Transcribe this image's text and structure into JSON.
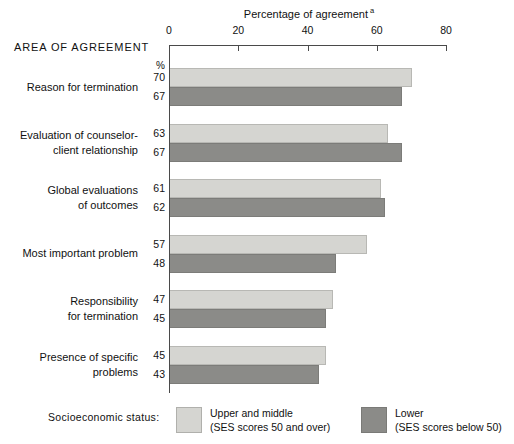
{
  "header": {
    "area_heading": "AREA OF AGREEMENT",
    "percent_symbol": "%"
  },
  "legend": {
    "title": "Socioeconomic status:",
    "items": [
      {
        "key": "upper",
        "label_line1": "Upper and middle",
        "label_line2": "(SES scores 50 and over)",
        "color": "#d5d5d1"
      },
      {
        "key": "lower",
        "label_line1": "Lower",
        "label_line2": "(SES scores below 50)",
        "color": "#8b8b88"
      }
    ]
  },
  "chart_data": {
    "type": "bar",
    "orientation": "horizontal",
    "title": "Percentage of agreement",
    "title_footnote": "a",
    "xlabel": "",
    "ylabel": "AREA OF AGREEMENT",
    "xlim": [
      0,
      80
    ],
    "xticks": [
      0,
      20,
      40,
      60,
      80
    ],
    "xtick_labels": [
      "0",
      "20",
      "40",
      "60",
      "80"
    ],
    "grid": false,
    "value_unit": "%",
    "legend_position": "bottom",
    "categories": [
      "Reason for termination",
      "Evaluation of counselor-client relationship",
      "Global evaluations of outcomes",
      "Most important problem",
      "Responsibility for termination",
      "Presence of specific problems"
    ],
    "series": [
      {
        "name": "Upper and middle (SES scores 50 and over)",
        "color": "#d5d5d1",
        "values": [
          70,
          63,
          61,
          57,
          47,
          45
        ]
      },
      {
        "name": "Lower (SES scores below 50)",
        "color": "#8b8b88",
        "values": [
          67,
          67,
          62,
          48,
          45,
          43
        ]
      }
    ]
  },
  "category_label_lines": [
    [
      "Reason for termination"
    ],
    [
      "Evaluation of counselor-",
      "client relationship"
    ],
    [
      "Global evaluations",
      "of outcomes"
    ],
    [
      "Most important problem"
    ],
    [
      "Responsibility",
      "for termination"
    ],
    [
      "Presence of specific",
      "problems"
    ]
  ]
}
